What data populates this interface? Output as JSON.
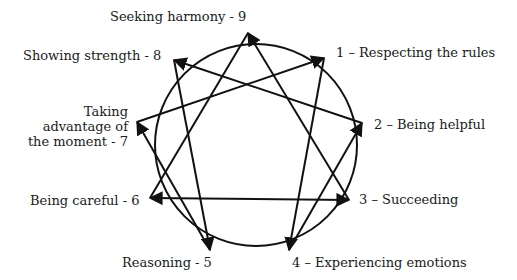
{
  "colors": {
    "stroke": "#111111",
    "text": "#1a1a1a",
    "background": "#ffffff"
  },
  "circle": {
    "cx": 256,
    "cy": 145,
    "r": 101
  },
  "points": [
    {
      "id": 9,
      "label": "Seeking harmony - 9",
      "x": 248,
      "y": 33
    },
    {
      "id": 1,
      "label": "1 – Respecting the rules",
      "x": 324,
      "y": 58
    },
    {
      "id": 2,
      "label": "2 – Being helpful",
      "x": 362,
      "y": 123
    },
    {
      "id": 3,
      "label": "3 – Succeeding",
      "x": 349,
      "y": 200
    },
    {
      "id": 4,
      "label": "4 – Experiencing emotions",
      "x": 289,
      "y": 250
    },
    {
      "id": 5,
      "label": "Reasoning - 5",
      "x": 210,
      "y": 250
    },
    {
      "id": 6,
      "label": "Being careful - 6",
      "x": 150,
      "y": 198
    },
    {
      "id": 7,
      "label_lines": [
        "Taking",
        "advantage of",
        "the moment - 7"
      ],
      "x": 137,
      "y": 122
    },
    {
      "id": 8,
      "label": "Showing strength - 8",
      "x": 174,
      "y": 60
    }
  ],
  "edges": [
    {
      "from": 3,
      "to": 9,
      "arrow": "end"
    },
    {
      "from": 6,
      "to": 9,
      "arrow": "none"
    },
    {
      "from": 6,
      "to": 3,
      "arrow": "both"
    },
    {
      "from": 1,
      "to": 4,
      "arrow": "end"
    },
    {
      "from": 4,
      "to": 2,
      "arrow": "end"
    },
    {
      "from": 2,
      "to": 8,
      "arrow": "end"
    },
    {
      "from": 8,
      "to": 5,
      "arrow": "end"
    },
    {
      "from": 5,
      "to": 7,
      "arrow": "end"
    },
    {
      "from": 7,
      "to": 1,
      "arrow": "end"
    }
  ],
  "labels": {
    "p9": "Seeking harmony - 9",
    "p1": "1 – Respecting the rules",
    "p2": "2 – Being helpful",
    "p3": "3 – Succeeding",
    "p4": "4 – Experiencing emotions",
    "p5": "Reasoning - 5",
    "p6": "Being careful - 6",
    "p7a": "Taking",
    "p7b": "advantage of",
    "p7c": "the moment - 7",
    "p8": "Showing strength - 8"
  }
}
